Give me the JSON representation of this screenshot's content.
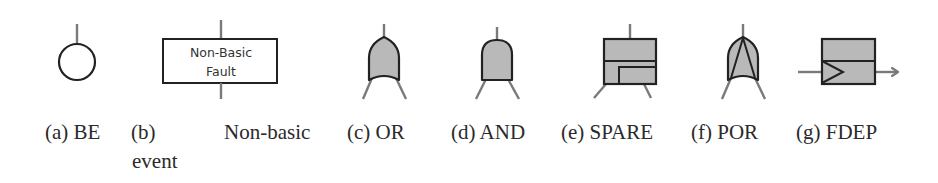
{
  "figure": {
    "colors": {
      "stroke": "#222222",
      "connector": "#7a7a7a",
      "gate_fill": "#b9b9b9",
      "background": "#ffffff"
    },
    "subfigures": [
      {
        "id": "a",
        "tag": "(a)",
        "name": "BE",
        "shape": "circle-icon"
      },
      {
        "id": "b",
        "tag": "(b)",
        "name": "Non-basic",
        "name_line2": "event",
        "shape": "rectangle-icon",
        "box_text_line1": "Non-Basic",
        "box_text_line2": "Fault"
      },
      {
        "id": "c",
        "tag": "(c)",
        "name": "OR",
        "shape": "or-gate-icon"
      },
      {
        "id": "d",
        "tag": "(d)",
        "name": "AND",
        "shape": "and-gate-icon"
      },
      {
        "id": "e",
        "tag": "(e)",
        "name": "SPARE",
        "shape": "spare-gate-icon"
      },
      {
        "id": "f",
        "tag": "(f)",
        "name": "POR",
        "shape": "por-gate-icon"
      },
      {
        "id": "g",
        "tag": "(g)",
        "name": "FDEP",
        "shape": "fdep-gate-icon"
      }
    ]
  }
}
